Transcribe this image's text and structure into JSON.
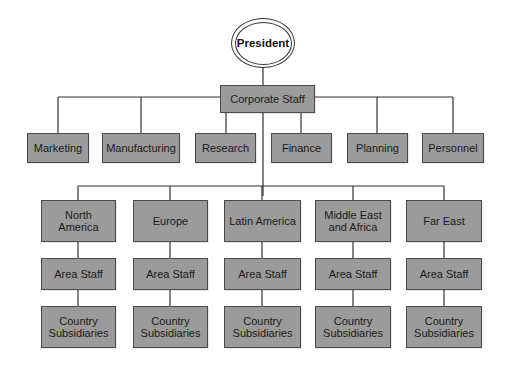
{
  "diagram": {
    "type": "organization-chart",
    "root": {
      "label": "President"
    },
    "corporate": {
      "label": "Corporate Staff"
    },
    "functions": [
      {
        "label": "Marketing"
      },
      {
        "label": "Manufacturing"
      },
      {
        "label": "Research"
      },
      {
        "label": "Finance"
      },
      {
        "label": "Planning"
      },
      {
        "label": "Personnel"
      }
    ],
    "regions": [
      {
        "label": "North America",
        "area_staff": "Area Staff",
        "subsidiaries": "Country Subsidiaries"
      },
      {
        "label": "Europe",
        "area_staff": "Area Staff",
        "subsidiaries": "Country Subsidiaries"
      },
      {
        "label": "Latin America",
        "area_staff": "Area Staff",
        "subsidiaries": "Country Subsidiaries"
      },
      {
        "label": "Middle East and Africa",
        "area_staff": "Area Staff",
        "subsidiaries": "Country Subsidiaries"
      },
      {
        "label": "Far East",
        "area_staff": "Area Staff",
        "subsidiaries": "Country Subsidiaries"
      }
    ],
    "colors": {
      "box_fill": "#9b9b9b",
      "box_border": "#4a4a4a",
      "line": "#333333",
      "background": "#ffffff"
    }
  }
}
